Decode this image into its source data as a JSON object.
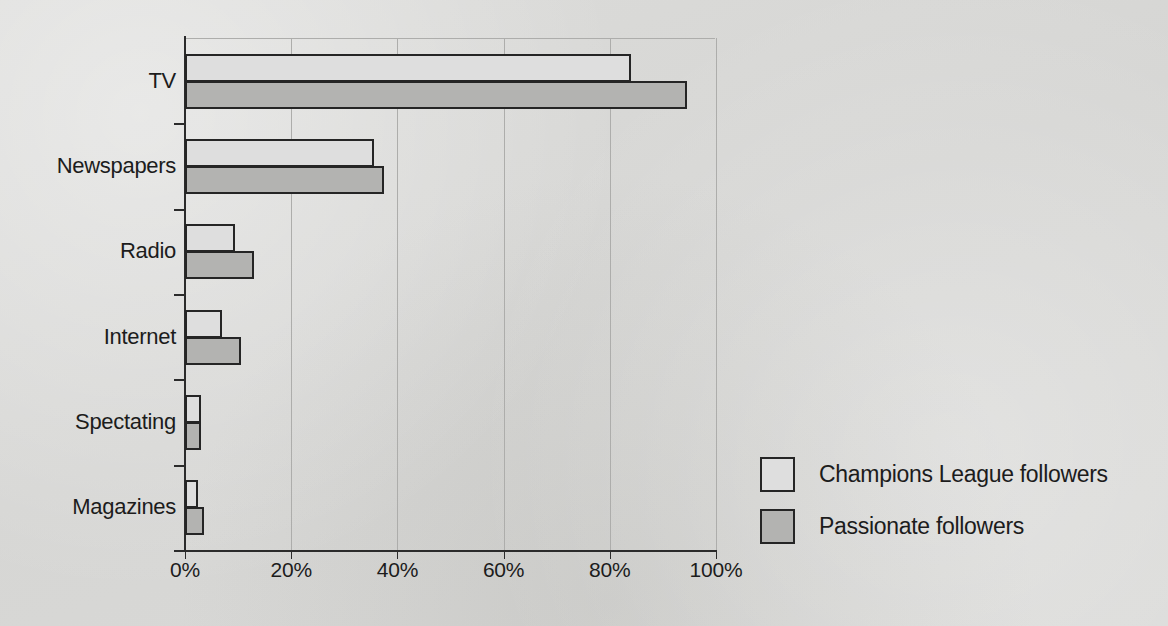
{
  "chart_data": {
    "type": "bar",
    "orientation": "horizontal",
    "title": "",
    "xlabel": "",
    "ylabel": "",
    "xlim": [
      0,
      100
    ],
    "grid": true,
    "legend_position": "right",
    "categories": [
      "TV",
      "Newspapers",
      "Radio",
      "Internet",
      "Spectating",
      "Magazines"
    ],
    "xtick_labels": [
      "0%",
      "20%",
      "40%",
      "60%",
      "80%",
      "100%"
    ],
    "xtick_values": [
      0,
      20,
      40,
      60,
      80,
      100
    ],
    "series": [
      {
        "name": "Champions League followers",
        "color": "#dedede",
        "values": [
          84,
          35.5,
          9.5,
          7,
          3,
          2.5
        ]
      },
      {
        "name": "Passionate followers",
        "color": "#b3b3b1",
        "values": [
          94.5,
          37.5,
          13,
          10.5,
          3,
          3.5
        ]
      }
    ]
  },
  "legend": {
    "items": [
      {
        "label": "Champions League followers",
        "swatch": "series-a"
      },
      {
        "label": "Passionate followers",
        "swatch": "series-b"
      }
    ]
  },
  "colors": {
    "background": "#d9d9d7",
    "bar_outline": "#252525",
    "gridline": "#adadab",
    "axis": "#2b2b2b",
    "text": "#1c1c1c"
  }
}
